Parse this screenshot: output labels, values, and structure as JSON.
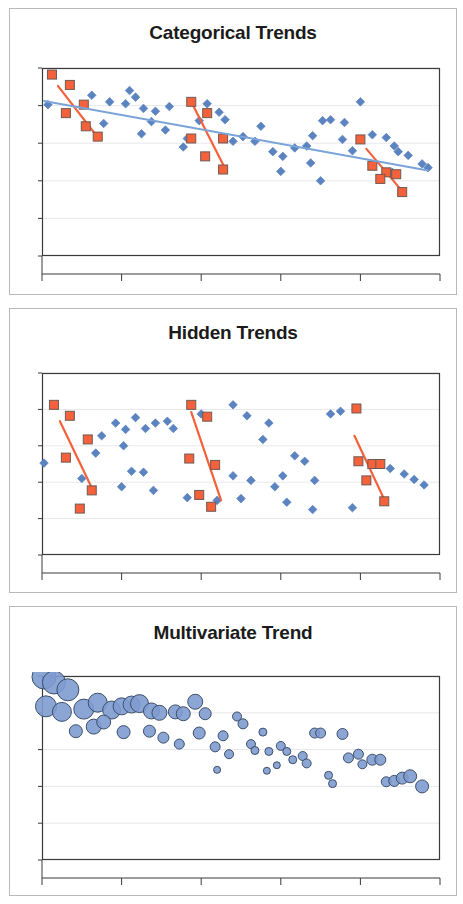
{
  "document": {
    "background": "#ffffff",
    "panel_border_color": "#b9b9bc"
  },
  "panels": [
    {
      "title": "Categorical Trends"
    },
    {
      "title": "Hidden Trends"
    },
    {
      "title": "Multivariate Trend"
    }
  ],
  "style": {
    "blue_marker": "#5b83c0",
    "blue_marker_fill": "#6c8fc9",
    "orange_marker": "#f4613b",
    "orange_marker_edge": "#6f5a52",
    "blue_trend_line": "#7aa3d8",
    "orange_trend_line": "#f4603a",
    "axis_color": "#3a3a3a",
    "gridline_color": "#e8e8ec",
    "bubble_fill": "#7e9bd0",
    "bubble_edge": "#3c4f6b"
  },
  "chart_data": [
    {
      "type": "scatter",
      "title": "Categorical Trends",
      "xlabel": "",
      "ylabel": "",
      "xlim": [
        0,
        100
      ],
      "ylim": [
        0,
        100
      ],
      "grid": true,
      "x_ticks": [
        0,
        20,
        40,
        60,
        80,
        100
      ],
      "y_ticks": [
        0,
        20,
        40,
        60,
        80,
        100
      ],
      "legend": "none",
      "series": [
        {
          "name": "Background points",
          "marker": "diamond",
          "color": "#5b83c0",
          "points": [
            [
              1.5,
              80.5
            ],
            [
              12.5,
              85.5
            ],
            [
              17.0,
              82.0
            ],
            [
              21.0,
              81.0
            ],
            [
              23.5,
              84.5
            ],
            [
              25.5,
              78.5
            ],
            [
              28.5,
              77.0
            ],
            [
              32.0,
              79.5
            ],
            [
              15.5,
              70.5
            ],
            [
              25.0,
              65.0
            ],
            [
              27.5,
              71.5
            ],
            [
              31.0,
              67.0
            ],
            [
              41.5,
              81.0
            ],
            [
              44.5,
              76.5
            ],
            [
              39.5,
              72.0
            ],
            [
              46.0,
              72.5
            ],
            [
              48.0,
              61.0
            ],
            [
              50.5,
              63.5
            ],
            [
              53.5,
              61.0
            ],
            [
              36.5,
              62.5
            ],
            [
              35.5,
              58.0
            ],
            [
              55.0,
              69.0
            ],
            [
              58.0,
              55.5
            ],
            [
              63.5,
              57.5
            ],
            [
              66.5,
              58.5
            ],
            [
              60.5,
              53.0
            ],
            [
              67.5,
              49.5
            ],
            [
              70.5,
              72.0
            ],
            [
              72.5,
              72.5
            ],
            [
              68.0,
              64.0
            ],
            [
              75.5,
              62.0
            ],
            [
              78.0,
              56.0
            ],
            [
              80.0,
              82.0
            ],
            [
              83.0,
              64.5
            ],
            [
              86.5,
              63.0
            ],
            [
              88.5,
              58.5
            ],
            [
              89.5,
              55.5
            ],
            [
              92.0,
              53.5
            ],
            [
              95.5,
              49.0
            ],
            [
              97.0,
              47.0
            ],
            [
              60.0,
              45.0
            ],
            [
              70.0,
              40.0
            ],
            [
              88.0,
              44.5
            ],
            [
              76.0,
              71.0
            ],
            [
              22.0,
              88.0
            ]
          ]
        },
        {
          "name": "Category A",
          "marker": "square",
          "color": "#f4613b",
          "points": [
            [
              2.5,
              96.5
            ],
            [
              7.0,
              91.0
            ],
            [
              10.5,
              80.5
            ],
            [
              6.0,
              76.0
            ],
            [
              11.0,
              69.0
            ],
            [
              14.0,
              63.5
            ]
          ],
          "trend": {
            "x0": 4.0,
            "y0": 90.5,
            "x1": 13.5,
            "y1": 64.5
          }
        },
        {
          "name": "Category B",
          "marker": "square",
          "color": "#f4613b",
          "points": [
            [
              37.5,
              82.0
            ],
            [
              41.5,
              76.0
            ],
            [
              37.5,
              62.5
            ],
            [
              45.5,
              62.5
            ],
            [
              41.0,
              53.0
            ],
            [
              45.5,
              46.0
            ]
          ],
          "trend": {
            "x0": 37.5,
            "y0": 82.0,
            "x1": 46.0,
            "y1": 46.5
          }
        },
        {
          "name": "Category C",
          "marker": "square",
          "color": "#f4613b",
          "points": [
            [
              80.0,
              62.0
            ],
            [
              83.0,
              48.0
            ],
            [
              86.5,
              44.5
            ],
            [
              89.0,
              43.5
            ],
            [
              85.0,
              41.0
            ],
            [
              90.5,
              34.0
            ]
          ],
          "trend": {
            "x0": 81.5,
            "y0": 57.0,
            "x1": 90.5,
            "y1": 34.5
          }
        },
        {
          "name": "Overall trend",
          "marker": "none",
          "color": "#7aa3d8",
          "trend": {
            "x0": 0.5,
            "y0": 82.5,
            "x1": 97.0,
            "y1": 45.5
          }
        }
      ]
    },
    {
      "type": "scatter",
      "title": "Hidden Trends",
      "xlabel": "",
      "ylabel": "",
      "xlim": [
        0,
        100
      ],
      "ylim": [
        0,
        100
      ],
      "grid": true,
      "x_ticks": [
        0,
        20,
        40,
        60,
        80,
        100
      ],
      "y_ticks": [
        0,
        20,
        40,
        60,
        80,
        100
      ],
      "legend": "none",
      "series": [
        {
          "name": "Background points",
          "marker": "diamond",
          "color": "#5b83c0",
          "points": [
            [
              0.5,
              50.5
            ],
            [
              15.0,
              65.5
            ],
            [
              18.5,
              72.5
            ],
            [
              21.0,
              69.0
            ],
            [
              23.5,
              75.5
            ],
            [
              26.0,
              69.5
            ],
            [
              28.5,
              72.5
            ],
            [
              31.5,
              73.5
            ],
            [
              33.0,
              69.5
            ],
            [
              13.5,
              56.0
            ],
            [
              20.5,
              60.0
            ],
            [
              22.5,
              46.0
            ],
            [
              25.5,
              45.5
            ],
            [
              28.0,
              35.5
            ],
            [
              20.0,
              37.5
            ],
            [
              36.5,
              31.5
            ],
            [
              48.0,
              82.5
            ],
            [
              51.5,
              76.5
            ],
            [
              57.0,
              72.5
            ],
            [
              55.5,
              63.5
            ],
            [
              48.0,
              43.5
            ],
            [
              52.5,
              41.0
            ],
            [
              58.5,
              37.5
            ],
            [
              50.0,
              31.0
            ],
            [
              63.5,
              54.5
            ],
            [
              66.0,
              51.5
            ],
            [
              60.5,
              43.5
            ],
            [
              68.5,
              41.0
            ],
            [
              61.5,
              29.0
            ],
            [
              72.5,
              77.5
            ],
            [
              75.0,
              79.0
            ],
            [
              83.0,
              50.0
            ],
            [
              87.5,
              47.5
            ],
            [
              91.0,
              44.5
            ],
            [
              93.5,
              41.5
            ],
            [
              96.0,
              38.5
            ],
            [
              40.0,
              77.5
            ],
            [
              44.0,
              30.0
            ],
            [
              68.0,
              25.0
            ],
            [
              78.0,
              26.0
            ],
            [
              10.0,
              42.0
            ]
          ]
        },
        {
          "name": "Group A",
          "marker": "square",
          "color": "#f4613b",
          "points": [
            [
              3.0,
              82.5
            ],
            [
              7.0,
              76.5
            ],
            [
              11.5,
              63.5
            ],
            [
              6.0,
              53.5
            ],
            [
              12.5,
              35.5
            ],
            [
              9.5,
              25.5
            ]
          ],
          "trend": {
            "x0": 4.5,
            "y0": 73.5,
            "x1": 12.5,
            "y1": 37.0
          }
        },
        {
          "name": "Group B",
          "marker": "square",
          "color": "#f4613b",
          "points": [
            [
              37.5,
              82.5
            ],
            [
              41.5,
              76.0
            ],
            [
              37.0,
              53.0
            ],
            [
              43.5,
              49.5
            ],
            [
              39.5,
              33.0
            ],
            [
              42.5,
              26.5
            ]
          ],
          "trend": {
            "x0": 37.5,
            "y0": 78.5,
            "x1": 45.0,
            "y1": 30.0
          }
        },
        {
          "name": "Group C",
          "marker": "square",
          "color": "#f4613b",
          "points": [
            [
              79.0,
              80.5
            ],
            [
              79.5,
              51.5
            ],
            [
              83.0,
              50.0
            ],
            [
              85.0,
              50.0
            ],
            [
              81.5,
              41.0
            ],
            [
              86.0,
              29.5
            ]
          ],
          "trend": {
            "x0": 78.5,
            "y0": 65.5,
            "x1": 86.0,
            "y1": 30.5
          }
        }
      ]
    },
    {
      "type": "bubble",
      "title": "Multivariate Trend",
      "xlabel": "",
      "ylabel": "",
      "xlim": [
        0,
        100
      ],
      "ylim": [
        0,
        100
      ],
      "grid": true,
      "x_ticks": [
        0,
        20,
        40,
        60,
        80,
        100
      ],
      "y_ticks": [
        0,
        20,
        40,
        60,
        80,
        100
      ],
      "legend": "none",
      "series": [
        {
          "name": "Observations",
          "color": "#7e9bd0",
          "points": [
            [
              0.5,
              99.5,
              12.0
            ],
            [
              3.0,
              96.5,
              11.5
            ],
            [
              6.5,
              92.5,
              11.0
            ],
            [
              1.0,
              83.5,
              10.5
            ],
            [
              5.0,
              80.5,
              9.5
            ],
            [
              10.5,
              82.0,
              10.0
            ],
            [
              14.0,
              85.5,
              9.5
            ],
            [
              17.5,
              81.5,
              9.0
            ],
            [
              20.0,
              83.5,
              8.5
            ],
            [
              22.5,
              84.5,
              8.5
            ],
            [
              24.5,
              85.0,
              9.0
            ],
            [
              27.5,
              81.0,
              8.0
            ],
            [
              29.5,
              80.0,
              7.5
            ],
            [
              33.5,
              80.5,
              7.0
            ],
            [
              35.5,
              79.5,
              7.0
            ],
            [
              13.0,
              72.5,
              7.5
            ],
            [
              8.5,
              70.0,
              6.5
            ],
            [
              15.5,
              75.0,
              7.0
            ],
            [
              20.5,
              69.5,
              6.5
            ],
            [
              27.0,
              70.0,
              6.0
            ],
            [
              30.5,
              66.5,
              5.5
            ],
            [
              34.5,
              63.0,
              5.0
            ],
            [
              38.5,
              86.0,
              7.5
            ],
            [
              41.0,
              79.5,
              6.0
            ],
            [
              39.5,
              69.0,
              6.0
            ],
            [
              43.5,
              61.5,
              5.0
            ],
            [
              45.5,
              67.5,
              5.0
            ],
            [
              49.0,
              78.0,
              4.5
            ],
            [
              50.5,
              74.0,
              5.0
            ],
            [
              47.0,
              57.5,
              4.5
            ],
            [
              52.5,
              63.0,
              4.5
            ],
            [
              55.5,
              69.5,
              4.0
            ],
            [
              53.5,
              59.5,
              4.0
            ],
            [
              57.0,
              59.0,
              4.0
            ],
            [
              60.0,
              62.0,
              4.5
            ],
            [
              61.5,
              59.0,
              4.0
            ],
            [
              63.0,
              54.5,
              4.0
            ],
            [
              59.0,
              51.5,
              3.5
            ],
            [
              65.5,
              56.5,
              4.5
            ],
            [
              68.5,
              69.0,
              5.0
            ],
            [
              70.0,
              69.0,
              5.0
            ],
            [
              66.5,
              52.5,
              4.5
            ],
            [
              72.0,
              46.0,
              4.0
            ],
            [
              75.5,
              68.5,
              5.5
            ],
            [
              77.0,
              55.5,
              5.0
            ],
            [
              79.5,
              57.5,
              5.0
            ],
            [
              80.5,
              52.0,
              4.5
            ],
            [
              83.0,
              54.5,
              5.5
            ],
            [
              85.0,
              54.5,
              5.5
            ],
            [
              86.5,
              42.5,
              5.0
            ],
            [
              88.5,
              43.0,
              5.5
            ],
            [
              90.5,
              44.5,
              6.0
            ],
            [
              92.5,
              45.5,
              6.5
            ],
            [
              95.5,
              40.0,
              6.5
            ],
            [
              44.0,
              49.0,
              3.5
            ],
            [
              56.5,
              48.5,
              3.5
            ],
            [
              73.0,
              41.5,
              4.0
            ]
          ]
        }
      ]
    }
  ]
}
